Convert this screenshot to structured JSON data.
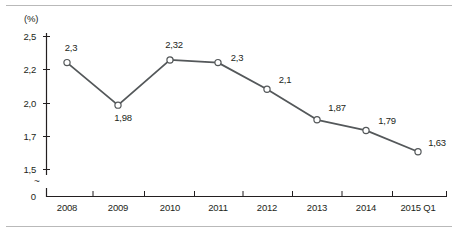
{
  "chart_data": {
    "type": "line",
    "title": "",
    "subtitle": "",
    "xlabel": "",
    "ylabel": "(%)",
    "unit_label": "(%)",
    "categories": [
      "2008",
      "2009",
      "2010",
      "2011",
      "2012",
      "2013",
      "2014",
      "2015 Q1"
    ],
    "values": [
      2.3,
      1.98,
      2.32,
      2.3,
      2.1,
      1.87,
      1.79,
      1.63
    ],
    "point_labels": [
      "2,3",
      "1,98",
      "2,32",
      "2,3",
      "2,1",
      "1,87",
      "1,79",
      "1,63"
    ],
    "series": [
      {
        "name": "",
        "values": [
          2.3,
          1.98,
          2.32,
          2.3,
          2.1,
          1.87,
          1.79,
          1.63
        ]
      }
    ],
    "ylim": [
      1.5,
      2.5
    ],
    "yticks": [
      2.5,
      2.2,
      2.0,
      1.7,
      1.5
    ],
    "ytick_labels": [
      "2,5",
      "2,2",
      "2,0",
      "1,7",
      "1,5"
    ],
    "axis_break": true,
    "axis_break_symbol": "~",
    "y_origin_label": "0",
    "grid": false,
    "legend": null,
    "legend_position": "none",
    "line_color": "#54585a",
    "marker_color": "#ffffff",
    "marker_edge_color": "#54585a",
    "axis_color": "#231f20",
    "label_color": "#231f20"
  },
  "ytick_layout": [
    {
      "label": "2,5",
      "y": 36
    },
    {
      "label": "2,2",
      "y": 69
    },
    {
      "label": "2,0",
      "y": 103
    },
    {
      "label": "1,7",
      "y": 136
    },
    {
      "label": "1,5",
      "y": 169
    }
  ],
  "xtick_layout": [
    {
      "label": "2008",
      "x": 67
    },
    {
      "label": "2009",
      "x": 118
    },
    {
      "label": "2010",
      "x": 170
    },
    {
      "label": "2011",
      "x": 218
    },
    {
      "label": "2012",
      "x": 267
    },
    {
      "label": "2013",
      "x": 317
    },
    {
      "label": "2014",
      "x": 366
    },
    {
      "label": "2015 Q1",
      "x": 418
    }
  ],
  "point_label_layout": [
    {
      "text": "2,3",
      "x": 71,
      "y": 47
    },
    {
      "text": "1,98",
      "x": 123,
      "y": 117
    },
    {
      "text": "2,32",
      "x": 174,
      "y": 44
    },
    {
      "text": "2,3",
      "x": 237,
      "y": 57
    },
    {
      "text": "2,1",
      "x": 285,
      "y": 79
    },
    {
      "text": "1,87",
      "x": 337,
      "y": 107
    },
    {
      "text": "1,79",
      "x": 387,
      "y": 120
    },
    {
      "text": "1,63",
      "x": 437,
      "y": 142
    }
  ],
  "axis_break_y": 181,
  "y_zero_y": 196
}
